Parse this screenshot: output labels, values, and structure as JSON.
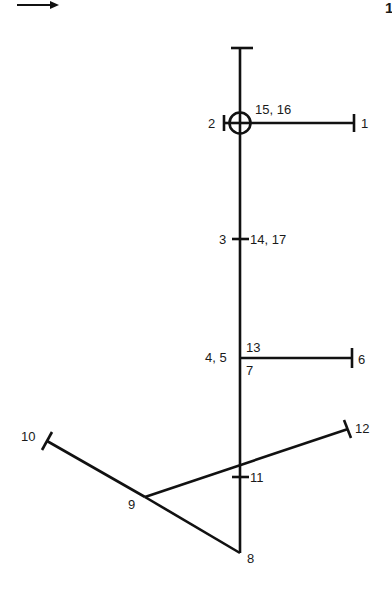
{
  "header": {
    "arrow_icon": "right-arrow-icon",
    "page_marker": "1"
  },
  "diagram": {
    "type": "stick-figure / branching line diagram",
    "colors": {
      "stroke": "#111111",
      "background": "#ffffff"
    },
    "nodes": {
      "top": {
        "x": 240,
        "y": 48,
        "label": ""
      },
      "n1": {
        "x": 354,
        "y": 123,
        "label": "1"
      },
      "n2": {
        "x": 229,
        "y": 123,
        "label": "2"
      },
      "n15_16": {
        "x": 240,
        "y": 123,
        "label": "15, 16"
      },
      "n3": {
        "x": 240,
        "y": 239,
        "label": "3"
      },
      "n14_17": {
        "x": 240,
        "y": 239,
        "label": "14, 17"
      },
      "n4_5": {
        "x": 240,
        "y": 358,
        "label": "4, 5"
      },
      "n13": {
        "x": 240,
        "y": 358,
        "label": "13"
      },
      "n7": {
        "x": 240,
        "y": 358,
        "label": "7"
      },
      "n6": {
        "x": 352,
        "y": 358,
        "label": "6"
      },
      "n12": {
        "x": 348,
        "y": 429,
        "label": "12"
      },
      "n10": {
        "x": 47,
        "y": 441,
        "label": "10"
      },
      "n11": {
        "x": 240,
        "y": 477,
        "label": "11"
      },
      "n9": {
        "x": 145,
        "y": 497,
        "label": "9"
      },
      "n8": {
        "x": 240,
        "y": 553,
        "label": "8"
      }
    },
    "labels": {
      "l1": "1",
      "l2": "2",
      "l15_16": "15, 16",
      "l3": "3",
      "l14_17": "14, 17",
      "l4_5": "4, 5",
      "l13": "13",
      "l7": "7",
      "l6": "6",
      "l10": "10",
      "l12": "12",
      "l11": "11",
      "l9": "9",
      "l8": "8"
    },
    "edges": [
      [
        "top",
        "n8"
      ],
      [
        "n15_16",
        "n1"
      ],
      [
        "n4_5",
        "n6"
      ],
      [
        "n10",
        "n9"
      ],
      [
        "n9",
        "n8"
      ],
      [
        "n9",
        "n12"
      ]
    ],
    "symbols": {
      "crosshair_circle": {
        "node": "n15_16",
        "radius": 10,
        "icon": "crosshair-circle-icon"
      }
    }
  }
}
